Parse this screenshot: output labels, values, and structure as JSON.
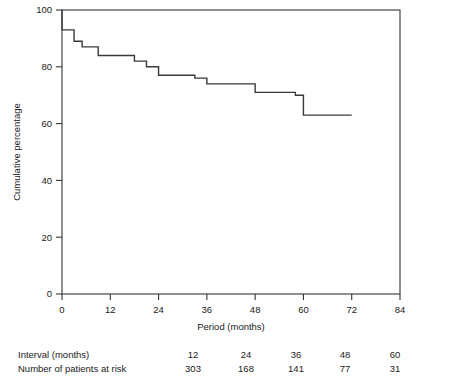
{
  "chart_data": {
    "type": "line",
    "subtype": "kaplan-meier-step",
    "title": "",
    "xlabel": "Period (months)",
    "ylabel": "Cumulative percentage",
    "xlim": [
      0,
      84
    ],
    "ylim": [
      0,
      100
    ],
    "xticks": [
      0,
      12,
      24,
      36,
      48,
      60,
      72,
      84
    ],
    "xtick_labels": [
      "0",
      "12",
      "24",
      "36",
      "48",
      "60",
      "72",
      "84"
    ],
    "yticks": [
      0,
      20,
      40,
      60,
      80,
      100
    ],
    "ytick_labels": [
      "0",
      "20",
      "40",
      "60",
      "80",
      "100"
    ],
    "grid": false,
    "legend": "none",
    "line_color": "#3a3a3a",
    "steps": [
      {
        "x": 0,
        "y": 100
      },
      {
        "x": 0,
        "y": 93
      },
      {
        "x": 3,
        "y": 93
      },
      {
        "x": 3,
        "y": 89
      },
      {
        "x": 5,
        "y": 89
      },
      {
        "x": 5,
        "y": 87
      },
      {
        "x": 9,
        "y": 87
      },
      {
        "x": 9,
        "y": 84
      },
      {
        "x": 18,
        "y": 84
      },
      {
        "x": 18,
        "y": 82
      },
      {
        "x": 21,
        "y": 82
      },
      {
        "x": 21,
        "y": 80
      },
      {
        "x": 24,
        "y": 80
      },
      {
        "x": 24,
        "y": 77
      },
      {
        "x": 33,
        "y": 77
      },
      {
        "x": 33,
        "y": 76
      },
      {
        "x": 36,
        "y": 76
      },
      {
        "x": 36,
        "y": 74
      },
      {
        "x": 48,
        "y": 74
      },
      {
        "x": 48,
        "y": 71
      },
      {
        "x": 58,
        "y": 71
      },
      {
        "x": 58,
        "y": 70
      },
      {
        "x": 60,
        "y": 70
      },
      {
        "x": 60,
        "y": 63
      },
      {
        "x": 72,
        "y": 63
      }
    ]
  },
  "risk_table": {
    "row_labels": [
      "Interval (months)",
      "Number of patients at risk"
    ],
    "interval_label": "Interval (months)",
    "at_risk_label": "Number of patients at risk",
    "intervals": [
      "12",
      "24",
      "36",
      "48",
      "60"
    ],
    "at_risk": [
      "303",
      "168",
      "141",
      "77",
      "31"
    ]
  }
}
